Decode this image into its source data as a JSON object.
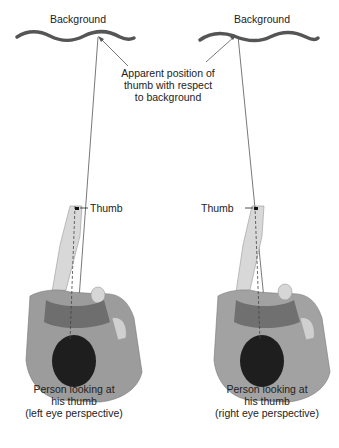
{
  "diagram": {
    "left_panel": {
      "background_label": "Background",
      "thumb_label": "Thumb",
      "caption": [
        "Person looking at",
        "his thumb",
        "(left eye perspective)"
      ]
    },
    "right_panel": {
      "background_label": "Background",
      "thumb_label": "Thumb",
      "caption": [
        "Person looking at",
        "his thumb",
        "(right eye perspective)"
      ]
    },
    "shared_annotation": [
      "Apparent position of",
      "thumb with respect",
      "to background"
    ],
    "colors": {
      "background_wave": "#555555",
      "sight_line": "#444444",
      "shirt": "#9a9a9a",
      "skin": "#d8d8d8",
      "hair": "#1e1e1e"
    }
  }
}
